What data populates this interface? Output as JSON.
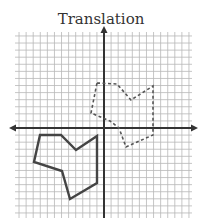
{
  "title": "Translation",
  "grid": {
    "left": 15,
    "right": 192,
    "top": 32,
    "bottom": 218,
    "spacing": 7.08,
    "origin_px": [
      104,
      128
    ],
    "grid_color": "#b8b8b8",
    "axis_color": "#333333"
  },
  "shapes": {
    "original": {
      "style": "solid",
      "color": "#444444",
      "points_px": [
        [
          40,
          135
        ],
        [
          61,
          135
        ],
        [
          76,
          150
        ],
        [
          97,
          136
        ],
        [
          97,
          183
        ],
        [
          70,
          199
        ],
        [
          62,
          171
        ],
        [
          34,
          162
        ]
      ]
    },
    "translated": {
      "style": "dashed",
      "color": "#555555",
      "points_px": [
        [
          97,
          83
        ],
        [
          117,
          84
        ],
        [
          131,
          100
        ],
        [
          153,
          86
        ],
        [
          153,
          135
        ],
        [
          126,
          147
        ],
        [
          119,
          128
        ],
        [
          110,
          121
        ],
        [
          91,
          113
        ]
      ]
    }
  }
}
